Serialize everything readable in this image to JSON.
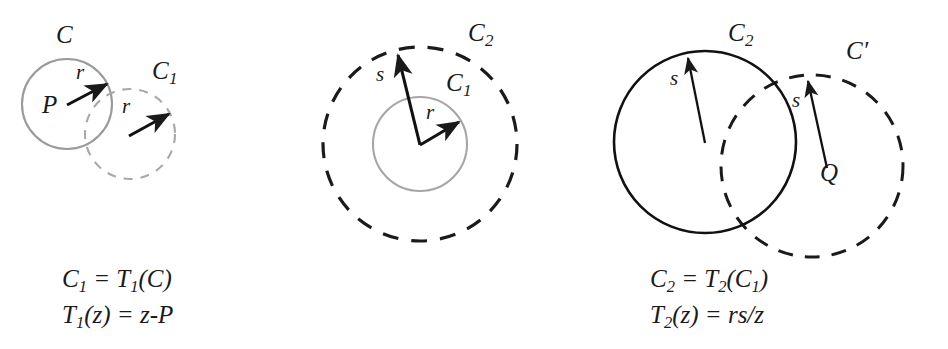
{
  "figure": {
    "type": "math-diagram",
    "colors": {
      "gray_stroke": "#9a9a9a",
      "black_stroke": "#1a1a1a",
      "background": "#ffffff",
      "text": "#1a1a1a"
    }
  },
  "panels": [
    {
      "id": "panel-1",
      "name": "translation-panel",
      "shapes": [
        {
          "name": "circle-C",
          "style": "solid",
          "color": "gray",
          "cx": 67,
          "cy": 104,
          "r": 45
        },
        {
          "name": "circle-C1",
          "style": "dashed",
          "color": "gray",
          "cx": 130,
          "cy": 134,
          "r": 45
        }
      ],
      "arrows": [
        {
          "name": "radius-arrow-r-on-C",
          "x1": 67,
          "y1": 105,
          "x2": 109,
          "y2": 83
        },
        {
          "name": "radius-arrow-r-on-C1",
          "x1": 129,
          "y1": 136,
          "x2": 171,
          "y2": 113
        }
      ],
      "labels": [
        {
          "name": "label-C",
          "base": "C",
          "sub": "",
          "x": 56,
          "y": 24,
          "size": "big"
        },
        {
          "name": "label-C1",
          "base": "C",
          "sub": "1",
          "x": 155,
          "y": 60,
          "size": "big"
        },
        {
          "name": "label-P",
          "base": "P",
          "sub": "",
          "x": 46,
          "y": 94,
          "size": "big"
        },
        {
          "name": "label-r-on-C",
          "base": "r",
          "sub": "",
          "x": 78,
          "y": 68,
          "size": "small"
        },
        {
          "name": "label-r-on-C1",
          "base": "r",
          "sub": "",
          "x": 124,
          "y": 101,
          "size": "small"
        }
      ],
      "caption": {
        "line1": {
          "lhs": "C",
          "lhs_sub": "1",
          "eq": " = ",
          "rhs": "T",
          "rhs_sub": "1",
          "rhs_tail": "(C)"
        },
        "line2": {
          "lhs": "T",
          "lhs_sub": "1",
          "lhs_tail": "(z)",
          "eq": " = ",
          "rhs_tail": "z-P"
        }
      }
    },
    {
      "id": "panel-2",
      "name": "inversion-panel",
      "shapes": [
        {
          "name": "circle-C1",
          "style": "solid",
          "color": "gray",
          "cx": 120,
          "cy": 144,
          "r": 47
        },
        {
          "name": "circle-C2",
          "style": "dashed",
          "color": "black",
          "cx": 120,
          "cy": 144,
          "r": 97
        }
      ],
      "arrows": [
        {
          "name": "radius-arrow-s-to-C2",
          "x1": 120,
          "y1": 145,
          "x2": 96,
          "y2": 50
        },
        {
          "name": "radius-arrow-r-to-C1",
          "x1": 120,
          "y1": 145,
          "x2": 161,
          "y2": 120
        }
      ],
      "labels": [
        {
          "name": "label-C2",
          "base": "C",
          "sub": "2",
          "x": 170,
          "y": 22,
          "size": "big"
        },
        {
          "name": "label-C1",
          "base": "C",
          "sub": "1",
          "x": 148,
          "y": 72,
          "size": "big"
        },
        {
          "name": "label-s",
          "base": "s",
          "sub": "",
          "x": 78,
          "y": 68,
          "size": "small"
        },
        {
          "name": "label-r",
          "base": "r",
          "sub": "",
          "x": 128,
          "y": 106,
          "size": "small"
        }
      ],
      "caption": {
        "line1": {
          "lhs": "C",
          "lhs_sub": "2",
          "eq": " = ",
          "rhs": "T",
          "rhs_sub": "2",
          "rhs_tail": "(C",
          "rhs_tail_sub": "1",
          "rhs_close": ")"
        },
        "line2": {
          "lhs": "T",
          "lhs_sub": "2",
          "lhs_tail": "(z)",
          "eq": " = ",
          "rhs_tail": "rs/z"
        }
      }
    },
    {
      "id": "panel-3",
      "name": "translation-back-panel",
      "shapes": [
        {
          "name": "circle-C2",
          "style": "solid",
          "color": "black",
          "cx": 105,
          "cy": 142,
          "r": 91
        },
        {
          "name": "circle-C-prime",
          "style": "dashed",
          "color": "black",
          "cx": 212,
          "cy": 166,
          "r": 91
        }
      ],
      "arrows": [
        {
          "name": "radius-arrow-s-on-C2",
          "x1": 105,
          "y1": 143,
          "x2": 86,
          "y2": 53
        },
        {
          "name": "radius-arrow-s-from-Q",
          "x1": 227,
          "y1": 168,
          "x2": 206,
          "y2": 76
        }
      ],
      "labels": [
        {
          "name": "label-C2",
          "base": "C",
          "sub": "2",
          "x": 130,
          "y": 22,
          "size": "big"
        },
        {
          "name": "label-C-prime",
          "base": "C′",
          "sub": "",
          "x": 248,
          "y": 40,
          "size": "big"
        },
        {
          "name": "label-s-on-C2",
          "base": "s",
          "sub": "",
          "x": 72,
          "y": 73,
          "size": "small"
        },
        {
          "name": "label-s-from-Q",
          "base": "s",
          "sub": "",
          "x": 194,
          "y": 95,
          "size": "small"
        },
        {
          "name": "label-Q",
          "base": "Q",
          "sub": "",
          "x": 224,
          "y": 163,
          "size": "big"
        }
      ],
      "caption": {
        "line1": {
          "lhs": "C′",
          "lhs_sub": "",
          "eq": " = ",
          "rhs": "T",
          "rhs_sub": "3",
          "rhs_tail": "(C",
          "rhs_tail_sub": "2",
          "rhs_close": ")"
        },
        "line2": {
          "lhs": "T",
          "lhs_sub": "3",
          "lhs_tail": "(z)",
          "eq": " = ",
          "rhs_tail": "z+Q"
        }
      }
    }
  ],
  "captions": {
    "panel1": {
      "line1_a": "C",
      "line1_sub": "1",
      "line1_b": " = T",
      "line1_sub2": "1",
      "line1_c": "(C)",
      "line2_a": "T",
      "line2_sub": "1",
      "line2_b": "(z) = z-P"
    },
    "panel2": {
      "line1_a": "C",
      "line1_sub": "2",
      "line1_b": " = T",
      "line1_sub2": "2",
      "line1_c": "(C",
      "line1_sub3": "1",
      "line1_d": ")",
      "line2_a": "T",
      "line2_sub": "2",
      "line2_b": "(z) = rs/z"
    },
    "panel3": {
      "line1_a": "C′",
      "line1_b": " = T",
      "line1_sub2": "3",
      "line1_c": "(C",
      "line1_sub3": "2",
      "line1_d": ")",
      "line2_a": "T",
      "line2_sub": "3",
      "line2_b": "(z) = z+Q"
    }
  }
}
